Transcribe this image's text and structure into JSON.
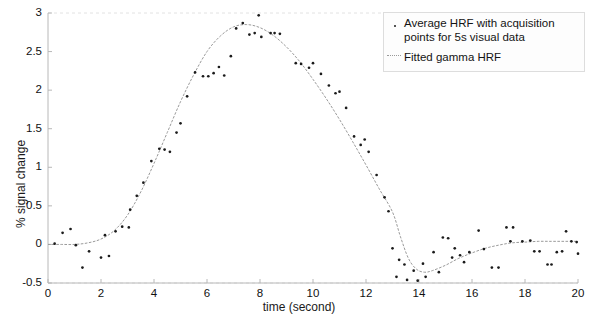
{
  "chart_data": {
    "type": "scatter",
    "title": "",
    "xlabel": "time (second)",
    "ylabel": "% signal change",
    "xlim": [
      0,
      20
    ],
    "ylim": [
      -0.5,
      3
    ],
    "xticks": [
      0,
      2,
      4,
      6,
      8,
      10,
      12,
      14,
      16,
      18,
      20
    ],
    "xtick_labels": [
      "0",
      "2",
      "4",
      "6",
      "8",
      "10",
      "12",
      "14",
      "16",
      "18",
      "20"
    ],
    "yticks": [
      -0.5,
      0,
      0.5,
      1,
      1.5,
      2,
      2.5,
      3
    ],
    "ytick_labels": [
      "-0.5",
      "0",
      "0.5",
      "1",
      "1.5",
      "2",
      "2.5",
      "3"
    ],
    "grid": false,
    "legend_position": "top-right",
    "colors": {
      "marker": "#1b1b1b",
      "fitted_line": "#9a9a9a",
      "axis": "#b8b8b8",
      "text": "#111111",
      "background": "#ffffff"
    },
    "series": [
      {
        "name": "Average HRF with acquisition points for 5s visual data",
        "type": "scatter",
        "marker": "point",
        "color": "#1b1b1b",
        "points": [
          [
            0.25,
            0.01
          ],
          [
            0.55,
            0.15
          ],
          [
            0.85,
            0.2
          ],
          [
            1.05,
            -0.01
          ],
          [
            1.3,
            -0.3
          ],
          [
            1.55,
            -0.09
          ],
          [
            2.0,
            -0.17
          ],
          [
            2.15,
            0.12
          ],
          [
            2.3,
            -0.15
          ],
          [
            2.55,
            0.17
          ],
          [
            2.8,
            0.23
          ],
          [
            3.05,
            0.22
          ],
          [
            3.1,
            0.45
          ],
          [
            3.35,
            0.63
          ],
          [
            3.6,
            0.8
          ],
          [
            3.9,
            1.08
          ],
          [
            4.2,
            1.24
          ],
          [
            4.4,
            1.23
          ],
          [
            4.6,
            1.2
          ],
          [
            4.85,
            1.45
          ],
          [
            5.0,
            1.57
          ],
          [
            5.25,
            1.92
          ],
          [
            5.55,
            2.23
          ],
          [
            5.85,
            2.18
          ],
          [
            6.05,
            2.18
          ],
          [
            6.25,
            2.22
          ],
          [
            6.45,
            2.3
          ],
          [
            6.65,
            2.19
          ],
          [
            6.9,
            2.44
          ],
          [
            7.1,
            2.8
          ],
          [
            7.35,
            2.87
          ],
          [
            7.6,
            2.72
          ],
          [
            7.8,
            2.74
          ],
          [
            7.95,
            2.97
          ],
          [
            8.05,
            2.69
          ],
          [
            8.4,
            2.74
          ],
          [
            8.55,
            2.74
          ],
          [
            8.75,
            2.73
          ],
          [
            9.35,
            2.35
          ],
          [
            9.55,
            2.34
          ],
          [
            9.85,
            2.29
          ],
          [
            10.0,
            2.35
          ],
          [
            10.3,
            2.21
          ],
          [
            10.6,
            2.06
          ],
          [
            10.85,
            1.96
          ],
          [
            11.0,
            1.98
          ],
          [
            11.25,
            1.77
          ],
          [
            11.55,
            1.4
          ],
          [
            11.8,
            1.29
          ],
          [
            11.95,
            1.36
          ],
          [
            12.1,
            1.2
          ],
          [
            12.4,
            0.9
          ],
          [
            12.7,
            0.61
          ],
          [
            12.85,
            0.43
          ],
          [
            13.0,
            -0.05
          ],
          [
            13.15,
            -0.42
          ],
          [
            13.25,
            -0.2
          ],
          [
            13.45,
            -0.26
          ],
          [
            13.55,
            -0.46
          ],
          [
            13.8,
            -0.34
          ],
          [
            13.95,
            -0.47
          ],
          [
            14.15,
            -0.25
          ],
          [
            14.25,
            -0.42
          ],
          [
            14.55,
            -0.1
          ],
          [
            14.75,
            -0.36
          ],
          [
            14.9,
            0.09
          ],
          [
            15.1,
            0.08
          ],
          [
            15.25,
            -0.17
          ],
          [
            15.35,
            -0.05
          ],
          [
            15.55,
            -0.14
          ],
          [
            15.7,
            -0.23
          ],
          [
            15.9,
            -0.1
          ],
          [
            16.25,
            0.18
          ],
          [
            16.45,
            -0.06
          ],
          [
            16.75,
            -0.3
          ],
          [
            17.0,
            -0.3
          ],
          [
            17.3,
            0.22
          ],
          [
            17.45,
            0.04
          ],
          [
            17.55,
            0.22
          ],
          [
            17.9,
            0.04
          ],
          [
            18.2,
            0.05
          ],
          [
            18.35,
            -0.09
          ],
          [
            18.55,
            -0.09
          ],
          [
            18.85,
            -0.26
          ],
          [
            19.0,
            -0.26
          ],
          [
            19.2,
            -0.1
          ],
          [
            19.4,
            -0.09
          ],
          [
            19.55,
            0.17
          ],
          [
            19.75,
            0.04
          ],
          [
            19.95,
            0.03
          ],
          [
            20.0,
            -0.12
          ]
        ]
      },
      {
        "name": "Fitted gamma HRF",
        "type": "line",
        "color": "#9a9a9a",
        "points": [
          [
            0.0,
            0.0
          ],
          [
            0.5,
            0.0
          ],
          [
            1.0,
            0.0
          ],
          [
            1.5,
            0.02
          ],
          [
            2.0,
            0.07
          ],
          [
            2.5,
            0.18
          ],
          [
            3.0,
            0.38
          ],
          [
            3.5,
            0.68
          ],
          [
            4.0,
            1.05
          ],
          [
            4.5,
            1.45
          ],
          [
            5.0,
            1.85
          ],
          [
            5.5,
            2.2
          ],
          [
            6.0,
            2.5
          ],
          [
            6.5,
            2.7
          ],
          [
            7.0,
            2.82
          ],
          [
            7.5,
            2.85
          ],
          [
            8.0,
            2.81
          ],
          [
            8.5,
            2.71
          ],
          [
            9.0,
            2.56
          ],
          [
            9.5,
            2.37
          ],
          [
            10.0,
            2.14
          ],
          [
            10.5,
            1.89
          ],
          [
            11.0,
            1.62
          ],
          [
            11.5,
            1.33
          ],
          [
            12.0,
            1.03
          ],
          [
            12.5,
            0.72
          ],
          [
            13.0,
            0.42
          ],
          [
            13.3,
            0.1
          ],
          [
            13.6,
            -0.18
          ],
          [
            13.9,
            -0.32
          ],
          [
            14.2,
            -0.36
          ],
          [
            14.5,
            -0.34
          ],
          [
            15.0,
            -0.27
          ],
          [
            15.5,
            -0.18
          ],
          [
            16.0,
            -0.11
          ],
          [
            16.5,
            -0.05
          ],
          [
            17.0,
            -0.01
          ],
          [
            17.5,
            0.02
          ],
          [
            18.0,
            0.03
          ],
          [
            18.5,
            0.04
          ],
          [
            19.0,
            0.04
          ],
          [
            19.5,
            0.04
          ],
          [
            20.0,
            0.04
          ]
        ]
      }
    ],
    "legend": [
      {
        "label_line_1": "Average HRF with acquisition",
        "label_line_2": "points for 5s visual data",
        "marker": "point"
      },
      {
        "label_line_1": "Fitted gamma HRF",
        "marker": "line"
      }
    ]
  }
}
